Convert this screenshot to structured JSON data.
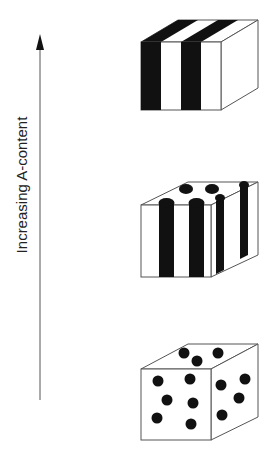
{
  "diagram": {
    "axis": {
      "label": "Increasing A-content",
      "direction": "up"
    },
    "colors": {
      "ink": "#111111",
      "outline": "#555555",
      "fill": "#ffffff"
    },
    "morphologies": [
      {
        "name": "lamellae",
        "description": "alternating black and white lamellar stripes",
        "position": "top"
      },
      {
        "name": "cylinders",
        "description": "hexagonally packed black cylinders",
        "position": "middle"
      },
      {
        "name": "spheres",
        "description": "black spheres dispersed in matrix",
        "position": "bottom"
      }
    ]
  }
}
